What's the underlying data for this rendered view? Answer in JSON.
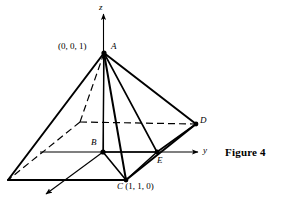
{
  "figure": {
    "caption": "Figure 4",
    "background_color": "#ffffff",
    "stroke_color": "#000000",
    "axes": {
      "z_label": "z",
      "y_label": "y",
      "x_label": ""
    },
    "vertices": [
      {
        "id": "A",
        "label": "A",
        "coord_text": "(0, 0, 1)",
        "x": 104,
        "y": 53,
        "dot": true
      },
      {
        "id": "B",
        "label": "B",
        "coord_text": "",
        "x": 103,
        "y": 152,
        "dot": true
      },
      {
        "id": "C",
        "label": "C",
        "coord_text": "(1, 1, 0)",
        "x": 126,
        "y": 180,
        "dot": true
      },
      {
        "id": "D",
        "label": "D",
        "coord_text": "",
        "x": 196,
        "y": 124,
        "dot": true
      },
      {
        "id": "E",
        "label": "E",
        "coord_text": "",
        "x": 157,
        "y": 152,
        "dot": true
      },
      {
        "id": "F",
        "label": "",
        "coord_text": "",
        "x": 8,
        "y": 180,
        "dot": false
      },
      {
        "id": "G",
        "label": "",
        "coord_text": "",
        "x": 80,
        "y": 122,
        "dot": false
      }
    ],
    "edges_solid": [
      {
        "name": "apex-to-F",
        "from": "A",
        "to": "F"
      },
      {
        "name": "apex-to-C",
        "from": "A",
        "to": "C"
      },
      {
        "name": "apex-to-D",
        "from": "A",
        "to": "D"
      },
      {
        "name": "apex-to-B",
        "from": "A",
        "to": "B"
      },
      {
        "name": "apex-to-E",
        "from": "A",
        "to": "E"
      },
      {
        "name": "base-F-C",
        "from": "F",
        "to": "C"
      },
      {
        "name": "base-C-D",
        "from": "C",
        "to": "D"
      },
      {
        "name": "base-B-C",
        "from": "B",
        "to": "C"
      },
      {
        "name": "base-B-E",
        "from": "B",
        "to": "E"
      },
      {
        "name": "base-E-C",
        "from": "E",
        "to": "C"
      },
      {
        "name": "base-E-D",
        "from": "E",
        "to": "D"
      }
    ],
    "edges_dashed": [
      {
        "name": "hidden-A-G",
        "from": "A",
        "to": "G"
      },
      {
        "name": "hidden-G-F",
        "from": "G",
        "to": "F"
      },
      {
        "name": "hidden-G-D",
        "from": "G",
        "to": "D"
      }
    ],
    "labels": {
      "apex_coord": "(0, 0, 1)",
      "apex_name": "A",
      "base_coord": "(1, 1, 0)",
      "base_name": "C",
      "b_name": "B",
      "d_name": "D",
      "e_name": "E"
    }
  }
}
